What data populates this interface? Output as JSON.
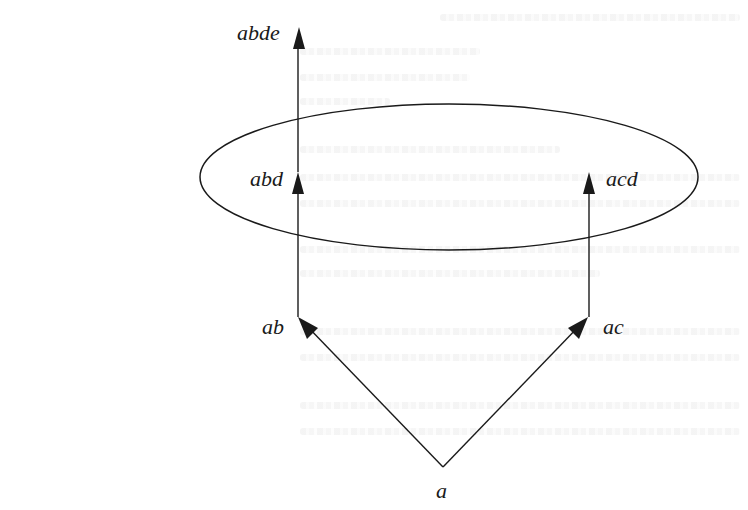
{
  "diagram": {
    "type": "directed-graph",
    "stroke_color": "#1a1a1a",
    "background": "#ffffff",
    "nodes": [
      {
        "id": "a",
        "label": "a",
        "x": 443,
        "y": 467
      },
      {
        "id": "ab",
        "label": "ab",
        "x": 298,
        "y": 317
      },
      {
        "id": "ac",
        "label": "ac",
        "x": 588,
        "y": 317
      },
      {
        "id": "abd",
        "label": "abd",
        "x": 298,
        "y": 177
      },
      {
        "id": "acd",
        "label": "acd",
        "x": 589,
        "y": 177
      },
      {
        "id": "abde",
        "label": "abde",
        "x": 299,
        "y": 28
      }
    ],
    "edges": [
      {
        "from": "a",
        "to": "ab"
      },
      {
        "from": "a",
        "to": "ac"
      },
      {
        "from": "ab",
        "to": "abd"
      },
      {
        "from": "ac",
        "to": "acd"
      },
      {
        "from": "abd",
        "to": "abde"
      }
    ],
    "ellipse": {
      "cx": 449,
      "cy": 177,
      "rx": 249,
      "ry": 73,
      "encloses": [
        "abd",
        "acd"
      ]
    }
  },
  "labels": {
    "a": "a",
    "ab": "ab",
    "ac": "ac",
    "abd": "abd",
    "acd": "acd",
    "abde": "abde"
  }
}
